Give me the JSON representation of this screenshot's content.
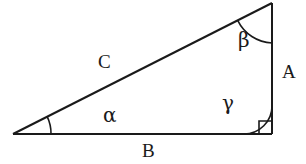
{
  "figure": {
    "type": "right-triangle-diagram",
    "background_color": "#ffffff",
    "stroke_color": "#1a1a1a",
    "stroke_width": 2,
    "width": 306,
    "height": 164
  },
  "vertices": {
    "left": {
      "x": 13,
      "y": 134
    },
    "top_right": {
      "x": 272,
      "y": 3
    },
    "bottom_right": {
      "x": 272,
      "y": 134
    }
  },
  "sides": [
    {
      "id": "A",
      "label": "A",
      "description": "vertical-right-leg",
      "from": "top_right",
      "to": "bottom_right"
    },
    {
      "id": "B",
      "label": "B",
      "description": "horizontal-bottom-leg",
      "from": "left",
      "to": "bottom_right"
    },
    {
      "id": "C",
      "label": "C",
      "description": "hypotenuse",
      "from": "left",
      "to": "top_right"
    }
  ],
  "angles": [
    {
      "id": "alpha",
      "label": "α",
      "at_vertex": "left",
      "marker": "arc",
      "arc_radius": 38
    },
    {
      "id": "beta",
      "label": "β",
      "at_vertex": "top_right",
      "marker": "arc",
      "arc_radius": 40
    },
    {
      "id": "gamma",
      "label": "γ",
      "at_vertex": "bottom_right",
      "marker": "arc-plus-right-angle-square",
      "arc_radius": 28,
      "square_size": 13
    }
  ],
  "labels": {
    "side_a": "A",
    "side_b": "B",
    "side_c": "C",
    "angle_alpha": "α",
    "angle_beta": "β",
    "angle_gamma": "γ"
  }
}
